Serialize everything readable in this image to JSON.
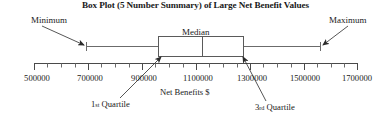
{
  "chart_data": {
    "type": "box",
    "title": "Box Plot (5 Number Summary) of Large Net Benefit Values",
    "xlabel": "Net Benefits $",
    "ylabel": "",
    "xlim": [
      450000,
      1750000
    ],
    "grid": false,
    "legend": "none",
    "tick_labels": [
      "500000",
      "700000",
      "900000",
      "1100000",
      "1300000",
      "1500000",
      "1700000"
    ],
    "tick_values": [
      500000,
      700000,
      900000,
      1100000,
      1300000,
      1500000,
      1700000
    ],
    "minor_ticks_between": 1,
    "five_number_summary": {
      "minimum": 650000,
      "q1": 975000,
      "median": 1115000,
      "q3": 1320000,
      "maximum": 1555000
    },
    "annotations": [
      {
        "label": "Minimum",
        "target": "minimum"
      },
      {
        "label": "Maximum",
        "target": "maximum"
      },
      {
        "label": "Median",
        "target": "median"
      },
      {
        "label": "1st Quartile",
        "target": "q1"
      },
      {
        "label": "3rd Quartile",
        "target": "q3"
      }
    ]
  },
  "figure": {
    "title": "Box Plot (5 Number Summary) of Large Net Benefit Values",
    "axis_title": "Net Benefits $",
    "labels": {
      "minimum": "Minimum",
      "maximum": "Maximum",
      "median": "Median",
      "q1_ordinal_number": "1",
      "q1_ordinal_suffix": "st",
      "q1_word": "Quartile",
      "q3_ordinal_number": "3",
      "q3_ordinal_suffix": "rd",
      "q3_word": "Quartile"
    },
    "ticks": [
      {
        "label": "500000",
        "x": 37
      },
      {
        "label": "700000",
        "x": 90
      },
      {
        "label": "900000",
        "x": 144
      },
      {
        "label": "1100000",
        "x": 198
      },
      {
        "label": "1300000",
        "x": 252
      },
      {
        "label": "1500000",
        "x": 305
      },
      {
        "label": "1700000",
        "x": 357
      }
    ],
    "colors": {
      "ink": "#1a1a1a",
      "line": "#555555",
      "box_stroke": "#5a5a5a",
      "background": "#ffffff"
    }
  }
}
